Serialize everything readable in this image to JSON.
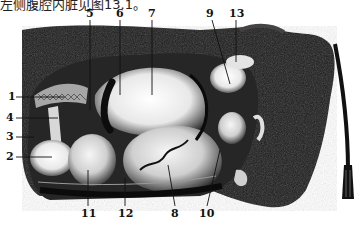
{
  "caption": {
    "text": "左侧腹腔内脏见图13.1。"
  },
  "figure": {
    "ink_color": "#111111",
    "paper_color": "#ffffff",
    "labels": [
      {
        "id": "1",
        "x": 8,
        "y": 93
      },
      {
        "id": "2",
        "x": 6,
        "y": 153
      },
      {
        "id": "3",
        "x": 6,
        "y": 133
      },
      {
        "id": "4",
        "x": 6,
        "y": 114
      },
      {
        "id": "5",
        "x": 87,
        "y": 8
      },
      {
        "id": "6",
        "x": 117,
        "y": 8
      },
      {
        "id": "7",
        "x": 148,
        "y": 8
      },
      {
        "id": "8",
        "x": 172,
        "y": 209
      },
      {
        "id": "9",
        "x": 207,
        "y": 8
      },
      {
        "id": "10",
        "x": 203,
        "y": 209
      },
      {
        "id": "11",
        "x": 84,
        "y": 209
      },
      {
        "id": "12",
        "x": 120,
        "y": 209
      },
      {
        "id": "13",
        "x": 232,
        "y": 8
      }
    ]
  }
}
